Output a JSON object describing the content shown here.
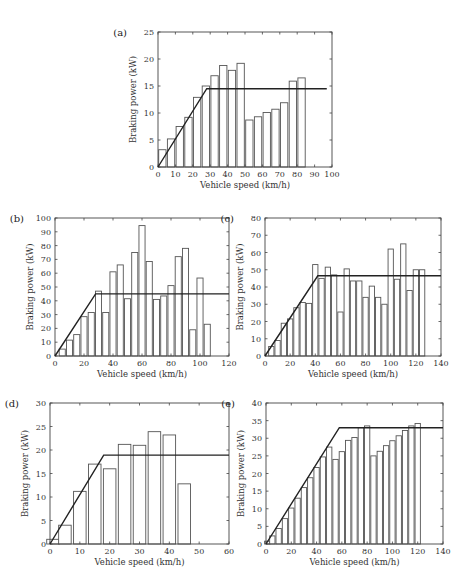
{
  "chart_data": [
    {
      "id": "a",
      "panel_label": "(a)",
      "type": "bar",
      "xlabel": "Vehicle speed (km/h)",
      "ylabel": "Braking power (kW)",
      "xlim": [
        0,
        100
      ],
      "ylim": [
        0,
        25
      ],
      "xticks": [
        0,
        10,
        20,
        30,
        40,
        50,
        60,
        70,
        80,
        90,
        100
      ],
      "yticks": [
        0,
        5,
        10,
        15,
        20,
        25
      ],
      "bar_width": 4.2,
      "x": [
        2.5,
        7.5,
        12.5,
        17.5,
        22.5,
        27.5,
        32.5,
        37.5,
        42.5,
        47.5,
        52.5,
        57.5,
        62.5,
        67.5,
        72.5,
        77.5,
        82.5
      ],
      "values": [
        3.2,
        5.2,
        7.5,
        9.2,
        12.9,
        15.0,
        16.9,
        18.8,
        17.9,
        19.2,
        8.7,
        9.3,
        10.1,
        10.7,
        11.9,
        15.9,
        16.5
      ],
      "line": {
        "x": [
          0,
          28,
          97
        ],
        "y": [
          0,
          14.5,
          14.5
        ]
      },
      "frame": {
        "left": 158,
        "top": 32,
        "right": 332,
        "bottom": 167
      }
    },
    {
      "id": "b",
      "panel_label": "(b)",
      "type": "bar",
      "xlabel": "Vehicle speed (km/h)",
      "ylabel": "Braking power (kW)",
      "xlim": [
        0,
        120
      ],
      "ylim": [
        0,
        100
      ],
      "xticks": [
        0,
        20,
        40,
        60,
        80,
        100,
        120
      ],
      "yticks": [
        0,
        10,
        20,
        30,
        40,
        50,
        60,
        70,
        80,
        90,
        100
      ],
      "bar_width": 4.2,
      "x": [
        5,
        10,
        15,
        20,
        25,
        30,
        35,
        40,
        45,
        50,
        55,
        60,
        65,
        70,
        75,
        80,
        85,
        90,
        95,
        100,
        105
      ],
      "values": [
        5,
        11.5,
        15.5,
        28.5,
        31.5,
        47,
        31.5,
        61,
        66,
        41.5,
        75,
        94.5,
        68.5,
        41,
        43.5,
        51,
        72,
        78,
        19,
        56.5,
        23
      ],
      "line": {
        "x": [
          0,
          28,
          120
        ],
        "y": [
          0,
          45,
          45
        ]
      },
      "frame": {
        "left": 55,
        "top": 218,
        "right": 229,
        "bottom": 356
      }
    },
    {
      "id": "c",
      "panel_label": "(c)",
      "type": "bar",
      "xlabel": "Vehicle speed (km/h)",
      "ylabel": "Braking power (kW)",
      "xlim": [
        0,
        140
      ],
      "ylim": [
        0,
        80
      ],
      "xticks": [
        0,
        20,
        40,
        60,
        80,
        100,
        120,
        140
      ],
      "yticks": [
        0,
        10,
        20,
        30,
        40,
        50,
        60,
        70,
        80
      ],
      "bar_width": 4.2,
      "x": [
        5,
        10,
        15,
        20,
        25,
        30,
        35,
        40,
        45,
        50,
        55,
        60,
        65,
        70,
        75,
        80,
        85,
        90,
        95,
        100,
        105,
        110,
        115,
        120,
        125
      ],
      "values": [
        5.5,
        9,
        19,
        21.5,
        28,
        31,
        30.5,
        53,
        45,
        51.5,
        47,
        25.5,
        50.5,
        43.5,
        43.5,
        34,
        40.5,
        34,
        30,
        62,
        44.5,
        65,
        38,
        50,
        50
      ],
      "line": {
        "x": [
          0,
          42,
          140
        ],
        "y": [
          0,
          46.5,
          46.5
        ]
      },
      "frame": {
        "left": 265,
        "top": 218,
        "right": 441,
        "bottom": 356
      }
    },
    {
      "id": "d",
      "panel_label": "(d)",
      "type": "bar",
      "xlabel": "Vehicle speed (km/h)",
      "ylabel": "Braking power (kW)",
      "xlim": [
        0,
        60
      ],
      "ylim": [
        0,
        30
      ],
      "xticks": [
        0,
        10,
        20,
        30,
        40,
        50,
        60
      ],
      "yticks": [
        0,
        5,
        10,
        15,
        20,
        25,
        30
      ],
      "bar_width": 4.2,
      "x": [
        1,
        5,
        10,
        15,
        20,
        25,
        30,
        35,
        40,
        45
      ],
      "values": [
        1,
        4,
        11.2,
        17,
        16,
        21.2,
        21,
        23.9,
        23.2,
        12.8
      ],
      "line": {
        "x": [
          0,
          18,
          60
        ],
        "y": [
          0,
          18.9,
          18.9
        ]
      },
      "frame": {
        "left": 50,
        "top": 403,
        "right": 229,
        "bottom": 544
      }
    },
    {
      "id": "e",
      "panel_label": "(e)",
      "type": "bar",
      "xlabel": "Vehicle speed (km/h)",
      "ylabel": "Braking power (kW)",
      "xlim": [
        0,
        140
      ],
      "ylim": [
        0,
        40
      ],
      "xticks": [
        0,
        20,
        40,
        60,
        80,
        100,
        120,
        140
      ],
      "yticks": [
        0,
        5,
        10,
        15,
        20,
        25,
        30,
        35,
        40
      ],
      "bar_width": 4.2,
      "x": [
        1,
        5,
        10,
        15,
        20,
        25,
        30,
        35,
        40,
        45,
        50,
        55,
        60,
        65,
        70,
        75,
        80,
        85,
        90,
        95,
        100,
        105,
        110,
        115,
        120
      ],
      "values": [
        0.8,
        2.3,
        4.4,
        7.2,
        10.2,
        13,
        16,
        18.8,
        21.7,
        24.7,
        27.5,
        24,
        26.2,
        29.4,
        30.2,
        33,
        33.5,
        25,
        26.3,
        27.9,
        29.3,
        30.7,
        32.2,
        33.5,
        34.2
      ],
      "line": {
        "x": [
          0,
          58,
          140
        ],
        "y": [
          0,
          33,
          33
        ]
      },
      "frame": {
        "left": 266,
        "top": 403,
        "right": 443,
        "bottom": 544
      }
    }
  ]
}
